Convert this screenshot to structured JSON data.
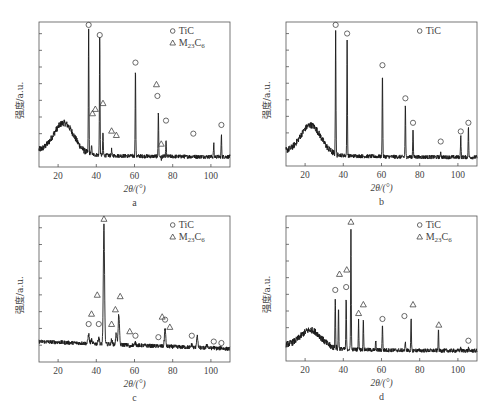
{
  "figure": {
    "panels": [
      {
        "id": "a",
        "label": "a"
      },
      {
        "id": "b",
        "label": "b"
      },
      {
        "id": "c",
        "label": "c"
      },
      {
        "id": "d",
        "label": "d"
      }
    ]
  },
  "chart_data": [
    {
      "panel": "a",
      "type": "line",
      "title": "",
      "xlabel": "2θ/(°)",
      "ylabel": "强度/a.u.",
      "xlim": [
        10,
        110
      ],
      "xticks": [
        20,
        40,
        60,
        80,
        100
      ],
      "y_ticks_count": 8,
      "yticklabels_shown": false,
      "legend": {
        "position": "top-right",
        "entries": [
          {
            "marker": "circle",
            "label": "TiC"
          },
          {
            "marker": "triangle",
            "label": "M23C6"
          }
        ]
      },
      "background": {
        "type": "amorphous-hump",
        "center": 23,
        "level": 0.28,
        "baseline": 0.07
      },
      "peaks": [
        {
          "x": 36.0,
          "height": 0.95,
          "phase": "TiC"
        },
        {
          "x": 37.5,
          "height": 0.16,
          "phase": "M23C6"
        },
        {
          "x": 41.8,
          "height": 0.9,
          "phase": "TiC"
        },
        {
          "x": 43.5,
          "height": 0.24,
          "phase": "M23C6"
        },
        {
          "x": 48.0,
          "height": 0.12,
          "phase": "M23C6"
        },
        {
          "x": 50.5,
          "height": 0.08,
          "phase": "M23C6"
        },
        {
          "x": 60.5,
          "height": 0.68,
          "phase": "TiC"
        },
        {
          "x": 72.5,
          "height": 0.38,
          "phase": "TiC"
        },
        {
          "x": 74.0,
          "height": 0.05,
          "phase": "M23C6"
        },
        {
          "x": 76.5,
          "height": 0.18,
          "phase": "TiC"
        },
        {
          "x": 90.8,
          "height": 0.08,
          "phase": "TiC"
        },
        {
          "x": 101.5,
          "height": 0.16,
          "phase": "TiC"
        },
        {
          "x": 105.5,
          "height": 0.22,
          "phase": "TiC"
        }
      ],
      "markers": [
        {
          "x": 36.0,
          "y": 0.98,
          "type": "circle"
        },
        {
          "x": 41.8,
          "y": 0.91,
          "type": "circle"
        },
        {
          "x": 60.5,
          "y": 0.72,
          "type": "circle"
        },
        {
          "x": 72.0,
          "y": 0.49,
          "type": "circle"
        },
        {
          "x": 71.5,
          "y": 0.57,
          "type": "triangle"
        },
        {
          "x": 38.0,
          "y": 0.37,
          "type": "triangle"
        },
        {
          "x": 39.5,
          "y": 0.4,
          "type": "triangle"
        },
        {
          "x": 43.5,
          "y": 0.44,
          "type": "triangle"
        },
        {
          "x": 48.0,
          "y": 0.25,
          "type": "triangle"
        },
        {
          "x": 50.5,
          "y": 0.22,
          "type": "triangle"
        },
        {
          "x": 74.0,
          "y": 0.16,
          "type": "triangle"
        },
        {
          "x": 76.5,
          "y": 0.32,
          "type": "circle"
        },
        {
          "x": 90.8,
          "y": 0.23,
          "type": "circle"
        },
        {
          "x": 105.5,
          "y": 0.29,
          "type": "circle"
        }
      ]
    },
    {
      "panel": "b",
      "type": "line",
      "title": "",
      "xlabel": "2θ/(°)",
      "ylabel": "强度/a.u.",
      "xlim": [
        10,
        110
      ],
      "xticks": [
        20,
        40,
        60,
        80,
        100
      ],
      "y_ticks_count": 8,
      "yticklabels_shown": false,
      "legend": {
        "position": "top-right",
        "entries": [
          {
            "marker": "circle",
            "label": "TiC"
          }
        ]
      },
      "background": {
        "type": "amorphous-hump",
        "center": 23,
        "level": 0.26,
        "baseline": 0.06
      },
      "peaks": [
        {
          "x": 36.0,
          "height": 0.94,
          "phase": "TiC"
        },
        {
          "x": 42.0,
          "height": 0.88,
          "phase": "TiC"
        },
        {
          "x": 60.5,
          "height": 0.66,
          "phase": "TiC"
        },
        {
          "x": 72.5,
          "height": 0.43,
          "phase": "TiC"
        },
        {
          "x": 76.5,
          "height": 0.27,
          "phase": "TiC"
        },
        {
          "x": 91.0,
          "height": 0.1,
          "phase": "TiC"
        },
        {
          "x": 101.5,
          "height": 0.21,
          "phase": "TiC"
        },
        {
          "x": 105.5,
          "height": 0.27,
          "phase": "TiC"
        }
      ],
      "markers": [
        {
          "x": 36.0,
          "y": 0.98,
          "type": "circle"
        },
        {
          "x": 42.0,
          "y": 0.92,
          "type": "circle"
        },
        {
          "x": 60.5,
          "y": 0.7,
          "type": "circle"
        },
        {
          "x": 72.5,
          "y": 0.47,
          "type": "circle"
        },
        {
          "x": 76.5,
          "y": 0.3,
          "type": "circle"
        },
        {
          "x": 91.0,
          "y": 0.17,
          "type": "circle"
        },
        {
          "x": 101.5,
          "y": 0.24,
          "type": "circle"
        },
        {
          "x": 105.5,
          "y": 0.3,
          "type": "circle"
        }
      ]
    },
    {
      "panel": "c",
      "type": "line",
      "title": "",
      "xlabel": "2θ/(°)",
      "ylabel": "强度/a.u.",
      "xlim": [
        10,
        110
      ],
      "xticks": [
        20,
        40,
        60,
        80,
        100
      ],
      "y_ticks_count": 8,
      "yticklabels_shown": false,
      "legend": {
        "position": "top-right",
        "entries": [
          {
            "marker": "circle",
            "label": "TiC"
          },
          {
            "marker": "triangle",
            "label": "M23C6"
          }
        ]
      },
      "background": {
        "type": "flat",
        "level": 0.14,
        "baseline": 0.09
      },
      "peaks": [
        {
          "x": 36.0,
          "height": 0.19,
          "phase": "TiC"
        },
        {
          "x": 37.5,
          "height": 0.15,
          "phase": "M23C6"
        },
        {
          "x": 41.3,
          "height": 0.17,
          "phase": "TiC"
        },
        {
          "x": 44.0,
          "height": 0.94,
          "phase": "M23C6"
        },
        {
          "x": 48.0,
          "height": 0.15,
          "phase": "M23C6"
        },
        {
          "x": 50.5,
          "height": 0.2,
          "phase": "M23C6"
        },
        {
          "x": 51.8,
          "height": 0.33,
          "phase": "M23C6"
        },
        {
          "x": 57.5,
          "height": 0.1,
          "phase": "M23C6"
        },
        {
          "x": 60.5,
          "height": 0.13,
          "phase": "TiC"
        },
        {
          "x": 72.5,
          "height": 0.11,
          "phase": "TiC"
        },
        {
          "x": 76.0,
          "height": 0.23,
          "phase": "TiC"
        },
        {
          "x": 90.0,
          "height": 0.12,
          "phase": "TiC"
        },
        {
          "x": 92.8,
          "height": 0.18,
          "phase": "M23C6"
        },
        {
          "x": 98.0,
          "height": 0.12,
          "phase": "M23C6"
        },
        {
          "x": 101.5,
          "height": 0.1,
          "phase": "TiC"
        },
        {
          "x": 105.5,
          "height": 0.1,
          "phase": "TiC"
        }
      ],
      "markers": [
        {
          "x": 36.0,
          "y": 0.26,
          "type": "circle"
        },
        {
          "x": 37.5,
          "y": 0.33,
          "type": "triangle"
        },
        {
          "x": 40.5,
          "y": 0.46,
          "type": "triangle"
        },
        {
          "x": 41.3,
          "y": 0.26,
          "type": "circle"
        },
        {
          "x": 44.0,
          "y": 0.98,
          "type": "triangle"
        },
        {
          "x": 48.0,
          "y": 0.26,
          "type": "triangle"
        },
        {
          "x": 50.0,
          "y": 0.36,
          "type": "triangle"
        },
        {
          "x": 52.5,
          "y": 0.45,
          "type": "triangle"
        },
        {
          "x": 57.5,
          "y": 0.21,
          "type": "triangle"
        },
        {
          "x": 60.5,
          "y": 0.18,
          "type": "circle"
        },
        {
          "x": 72.5,
          "y": 0.17,
          "type": "circle"
        },
        {
          "x": 74.5,
          "y": 0.31,
          "type": "triangle"
        },
        {
          "x": 76.0,
          "y": 0.29,
          "type": "circle"
        },
        {
          "x": 78.5,
          "y": 0.24,
          "type": "triangle"
        },
        {
          "x": 90.0,
          "y": 0.18,
          "type": "circle"
        },
        {
          "x": 101.5,
          "y": 0.14,
          "type": "circle"
        },
        {
          "x": 105.5,
          "y": 0.13,
          "type": "circle"
        }
      ]
    },
    {
      "panel": "d",
      "type": "line",
      "title": "",
      "xlabel": "2θ/(°)",
      "ylabel": "强度/a.u.",
      "xlim": [
        10,
        110
      ],
      "xticks": [
        20,
        40,
        60,
        80,
        100
      ],
      "y_ticks_count": 8,
      "yticklabels_shown": false,
      "legend": {
        "position": "top-right",
        "entries": [
          {
            "marker": "circle",
            "label": "TiC"
          },
          {
            "marker": "triangle",
            "label": "M23C6"
          }
        ]
      },
      "background": {
        "type": "amorphous-hump",
        "center": 23,
        "level": 0.19,
        "baseline": 0.07
      },
      "peaks": [
        {
          "x": 35.8,
          "height": 0.45,
          "phase": "TiC"
        },
        {
          "x": 37.5,
          "height": 0.37,
          "phase": "M23C6"
        },
        {
          "x": 41.5,
          "height": 0.43,
          "phase": "TiC"
        },
        {
          "x": 44.0,
          "height": 0.92,
          "phase": "M23C6"
        },
        {
          "x": 48.0,
          "height": 0.28,
          "phase": "M23C6"
        },
        {
          "x": 50.5,
          "height": 0.3,
          "phase": "M23C6"
        },
        {
          "x": 57.0,
          "height": 0.14,
          "phase": "M23C6"
        },
        {
          "x": 60.5,
          "height": 0.26,
          "phase": "TiC"
        },
        {
          "x": 72.5,
          "height": 0.14,
          "phase": "TiC"
        },
        {
          "x": 75.5,
          "height": 0.29,
          "phase": "M23C6"
        },
        {
          "x": 89.8,
          "height": 0.22,
          "phase": "M23C6"
        },
        {
          "x": 101.5,
          "height": 0.1,
          "phase": "TiC"
        },
        {
          "x": 105.5,
          "height": 0.09,
          "phase": "TiC"
        }
      ],
      "markers": [
        {
          "x": 35.8,
          "y": 0.49,
          "type": "circle"
        },
        {
          "x": 38.0,
          "y": 0.6,
          "type": "triangle"
        },
        {
          "x": 41.5,
          "y": 0.51,
          "type": "circle"
        },
        {
          "x": 41.8,
          "y": 0.63,
          "type": "triangle"
        },
        {
          "x": 44.0,
          "y": 0.96,
          "type": "triangle"
        },
        {
          "x": 48.0,
          "y": 0.33,
          "type": "triangle"
        },
        {
          "x": 50.5,
          "y": 0.39,
          "type": "triangle"
        },
        {
          "x": 60.5,
          "y": 0.29,
          "type": "circle"
        },
        {
          "x": 72.0,
          "y": 0.31,
          "type": "circle"
        },
        {
          "x": 76.5,
          "y": 0.39,
          "type": "triangle"
        },
        {
          "x": 90.0,
          "y": 0.25,
          "type": "triangle"
        },
        {
          "x": 105.5,
          "y": 0.14,
          "type": "circle"
        }
      ]
    }
  ]
}
